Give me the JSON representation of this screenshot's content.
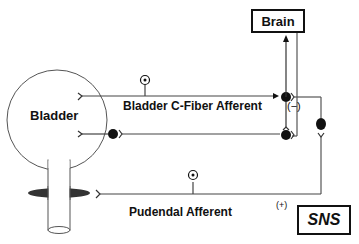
{
  "diagram": {
    "nodes": {
      "brain": {
        "label": "Brain"
      },
      "sns": {
        "label": "SNS"
      },
      "bladder": {
        "label": "Bladder"
      }
    },
    "pathways": {
      "bladder_c_fiber": {
        "label": "Bladder C-Fiber Afferent"
      },
      "pudendal": {
        "label": "Pudendal Afferent"
      }
    },
    "annotations": {
      "inhibitory": "(−)",
      "excitatory": "(+)"
    },
    "colors": {
      "line": "#555555",
      "stroke_dark": "#111111",
      "sphincter": "#333333"
    }
  }
}
